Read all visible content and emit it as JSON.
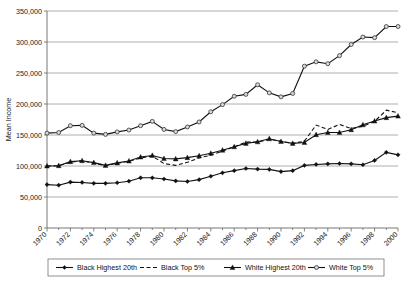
{
  "chart_data": {
    "type": "line",
    "title": "",
    "xlabel": "",
    "ylabel": "Mean Income",
    "ylim": [
      0,
      350000
    ],
    "xlim": [
      1970,
      2000
    ],
    "grid": true,
    "legend_position": "bottom",
    "ytick_labels": [
      "350,000",
      "300,000",
      "250,000",
      "200,000",
      "150,000",
      "100,000",
      "50,000",
      "0"
    ],
    "ytick_values": [
      350000,
      300000,
      250000,
      200000,
      150000,
      100000,
      50000,
      0
    ],
    "xtick_labels": [
      "1970",
      "1972",
      "1974",
      "1976",
      "1978",
      "1980",
      "1982",
      "1984",
      "1986",
      "1988",
      "1990",
      "1992",
      "1994",
      "1996",
      "1998",
      "2000"
    ],
    "xtick_values": [
      1970,
      1972,
      1974,
      1976,
      1978,
      1980,
      1982,
      1984,
      1986,
      1988,
      1990,
      1992,
      1994,
      1996,
      1998,
      2000
    ],
    "x": [
      1970,
      1971,
      1972,
      1973,
      1974,
      1975,
      1976,
      1977,
      1978,
      1979,
      1980,
      1981,
      1982,
      1983,
      1984,
      1985,
      1986,
      1987,
      1988,
      1989,
      1990,
      1991,
      1992,
      1993,
      1994,
      1995,
      1996,
      1997,
      1998,
      1999,
      2000
    ],
    "series": [
      {
        "name": "Black Highest 20th",
        "marker": "diamond",
        "line_style": "solid",
        "color": "#111111",
        "values": [
          70000,
          69000,
          74000,
          73500,
          72000,
          72000,
          73000,
          75500,
          81000,
          81000,
          79000,
          76000,
          75000,
          78000,
          83500,
          89000,
          92500,
          96000,
          95000,
          94500,
          91000,
          92500,
          101000,
          102500,
          103500,
          104000,
          103500,
          102000,
          109000,
          122000,
          118000
        ]
      },
      {
        "name": "Black Top 5%",
        "marker": "none",
        "line_style": "dashed",
        "color": "#111111",
        "values": [
          100000,
          100500,
          106000,
          108500,
          104500,
          100500,
          104500,
          107500,
          113000,
          116000,
          104000,
          101000,
          106000,
          113000,
          117500,
          124000,
          131000,
          138500,
          138500,
          143000,
          140000,
          136500,
          140000,
          166000,
          159000,
          167000,
          160500,
          164000,
          172000,
          190000,
          186000
        ]
      },
      {
        "name": "White Highest 20th",
        "marker": "triangle",
        "line_style": "solid",
        "color": "#111111",
        "values": [
          100000,
          100500,
          107000,
          108500,
          105500,
          101000,
          105000,
          108000,
          114500,
          117000,
          112000,
          111500,
          113500,
          116500,
          120500,
          125500,
          131000,
          136500,
          139000,
          144000,
          139500,
          136500,
          138000,
          150500,
          154000,
          154000,
          158500,
          166500,
          172500,
          178000,
          180500
        ]
      },
      {
        "name": "White Top 5%",
        "marker": "circle",
        "line_style": "solid",
        "color": "#d9d9d9",
        "values": [
          153000,
          154000,
          165000,
          165500,
          153000,
          151000,
          155000,
          158000,
          165000,
          172000,
          159000,
          155500,
          163000,
          171000,
          187500,
          199000,
          212500,
          215500,
          231000,
          218000,
          211500,
          217000,
          261000,
          268000,
          265000,
          278000,
          296000,
          308000,
          307000,
          325000,
          325000
        ]
      }
    ]
  },
  "legend": {
    "items": [
      {
        "label": "Black Highest 20th",
        "marker": "diamond",
        "style": "solid"
      },
      {
        "label": "Black Top 5%",
        "marker": "none",
        "style": "dashed"
      },
      {
        "label": "White Highest 20th",
        "marker": "triangle",
        "style": "solid"
      },
      {
        "label": "White Top 5%",
        "marker": "circle",
        "style": "solid"
      }
    ]
  }
}
